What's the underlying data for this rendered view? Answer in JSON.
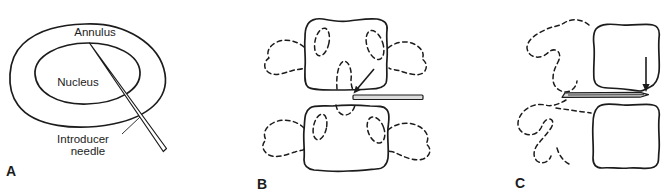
{
  "figure": {
    "type": "medical-line-diagram",
    "colors": {
      "line": "#1c1c1c",
      "background": "#ffffff",
      "needle_fill": "#dcdcdc"
    },
    "panel_a": {
      "letter": "A",
      "annulus_label": "Annulus",
      "nucleus_label": "Nucleus",
      "needle_label_line1": "Introducer",
      "needle_label_line2": "needle"
    },
    "panel_b": {
      "letter": "B"
    },
    "panel_c": {
      "letter": "C"
    }
  }
}
